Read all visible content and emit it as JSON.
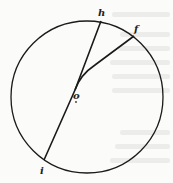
{
  "diagram": {
    "type": "geometry-circle",
    "circle": {
      "cx": 87,
      "cy": 97,
      "r": 76
    },
    "center_label": "o",
    "points": [
      {
        "id": "h",
        "label": "h",
        "x": 101,
        "y": 21,
        "label_x": 98,
        "label_y": 16
      },
      {
        "id": "f",
        "label": "f",
        "x": 134,
        "y": 36,
        "label_x": 134,
        "label_y": 32
      },
      {
        "id": "i",
        "label": "i",
        "x": 44,
        "y": 160,
        "label_x": 40,
        "label_y": 173
      }
    ],
    "junction": {
      "x": 75,
      "y": 90
    },
    "center": {
      "x": 76,
      "y": 97,
      "label_x": 73,
      "label_y": 98
    },
    "colors": {
      "stroke": "#1a1a1a",
      "background": "#fbfbf9",
      "bleed": "#ececea"
    }
  }
}
